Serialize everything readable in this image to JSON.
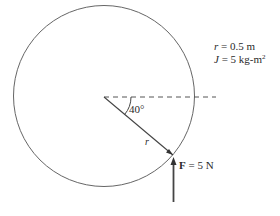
{
  "diagram": {
    "params": {
      "r_label": "r = 0.5 m",
      "r_symbol": "r",
      "r_rest": " = 0.5 m",
      "J_symbol": "J",
      "J_rest": " = 5 kg-m",
      "J_exp": "2"
    },
    "angle_label": "40°",
    "radius_label": "r",
    "force": {
      "symbol": "F",
      "rest": " = 5 N"
    },
    "colors": {
      "stroke": "#555555",
      "text": "#2a2a2a"
    }
  }
}
